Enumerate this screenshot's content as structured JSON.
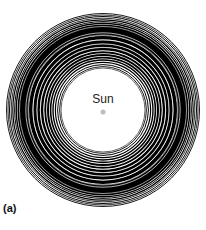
{
  "figure": {
    "panel_label": "(a)",
    "center_label": "Sun",
    "center": {
      "x": 103,
      "y": 110
    },
    "sun_dot": {
      "r": 2.5,
      "color": "#bdbdbd"
    },
    "inner_clear_radius": 41,
    "outer_radius": 97,
    "ring_color": "#000000",
    "background": "#ffffff",
    "bands": [
      {
        "r": 96.5,
        "w": 0.9
      },
      {
        "r": 95.0,
        "w": 0.8
      },
      {
        "r": 93.5,
        "w": 1.0
      },
      {
        "r": 91.8,
        "w": 0.8
      },
      {
        "r": 90.2,
        "w": 1.2
      },
      {
        "r": 88.4,
        "w": 1.0
      },
      {
        "r": 86.8,
        "w": 1.4
      },
      {
        "r": 80.0,
        "w": 11.0
      },
      {
        "r": 72.2,
        "w": 3.6
      },
      {
        "r": 68.0,
        "w": 3.4
      },
      {
        "r": 64.4,
        "w": 2.6
      },
      {
        "r": 61.0,
        "w": 2.8
      },
      {
        "r": 57.8,
        "w": 2.0
      },
      {
        "r": 55.0,
        "w": 2.0
      },
      {
        "r": 52.4,
        "w": 1.6
      },
      {
        "r": 50.0,
        "w": 1.4
      },
      {
        "r": 47.6,
        "w": 1.2
      },
      {
        "r": 45.4,
        "w": 1.0
      },
      {
        "r": 43.4,
        "w": 0.9
      },
      {
        "r": 42.0,
        "w": 0.6
      }
    ],
    "gaps": [
      {
        "r": 83.5,
        "w": 0.6
      },
      {
        "r": 77.2,
        "w": 0.7
      },
      {
        "r": 75.0,
        "w": 0.5
      },
      {
        "r": 70.1,
        "w": 0.6
      },
      {
        "r": 66.2,
        "w": 0.5
      },
      {
        "r": 62.7,
        "w": 0.6
      },
      {
        "r": 59.4,
        "w": 0.5
      }
    ]
  }
}
